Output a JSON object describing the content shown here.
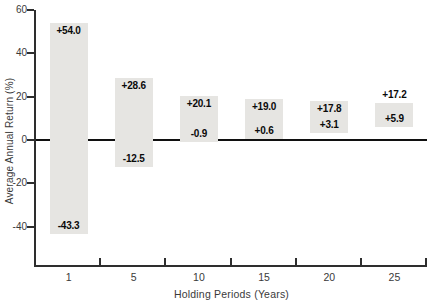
{
  "chart_data": {
    "type": "bar",
    "subtype": "floating-range-bars",
    "title": "",
    "xlabel": "Holding Periods (Years)",
    "ylabel": "Average Annual Return (%)",
    "categories": [
      "1",
      "5",
      "10",
      "15",
      "20",
      "25"
    ],
    "series": [
      {
        "name": "maximum-return",
        "values": [
          54.0,
          28.6,
          20.1,
          19.0,
          17.8,
          17.2
        ]
      },
      {
        "name": "minimum-return",
        "values": [
          -43.3,
          -12.5,
          -0.9,
          0.6,
          3.1,
          5.9
        ]
      }
    ],
    "point_labels": {
      "maximum-return": [
        "+54.0",
        "+28.6",
        "+20.1",
        "+19.0",
        "+17.8",
        "+17.2"
      ],
      "minimum-return": [
        "-43.3",
        "-12.5",
        "-0.9",
        "+0.6",
        "+3.1",
        "+5.9"
      ]
    },
    "max_label_outside": [
      false,
      false,
      false,
      false,
      false,
      true
    ],
    "yticks": [
      60,
      40,
      20,
      0,
      -20,
      -40
    ],
    "ylim": [
      -57,
      60
    ],
    "grid": false,
    "zero_line": true,
    "legend": "none",
    "colors": {
      "bar_fill": "#e6e5e2",
      "axis": "#2e2e2e",
      "zero_line": "#101010",
      "tick_text": "#3a3a3a",
      "bar_label_text": "#0a0a0a",
      "background": "#ffffff"
    }
  }
}
